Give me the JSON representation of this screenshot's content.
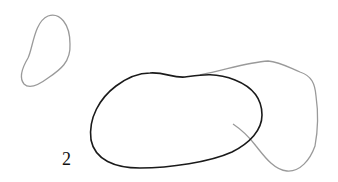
{
  "figure": {
    "label": "2",
    "colors": {
      "background": "#ffffff",
      "primary_curve": "#1a1a1a",
      "secondary_curve": "#9a9a9a"
    },
    "shapes": [
      {
        "name": "small-gray-blob",
        "stroke": "#9a9a9a",
        "closed": true
      },
      {
        "name": "large-black-closed-curve",
        "stroke": "#1a1a1a",
        "closed": true
      },
      {
        "name": "gray-open-curve",
        "stroke": "#9a9a9a",
        "closed": false
      }
    ]
  }
}
